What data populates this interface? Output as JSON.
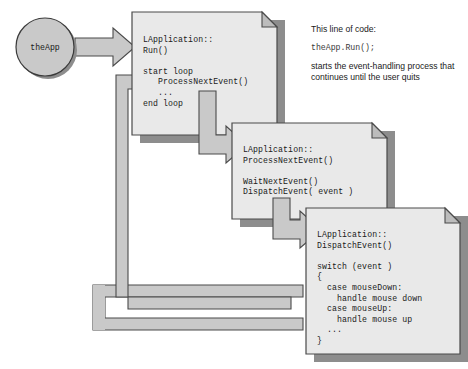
{
  "diagram": {
    "type": "flow-diagram",
    "colors": {
      "card_fill": "#e9e9e9",
      "card_border": "#4a4a4a",
      "card_shadow": "#7a7a7a",
      "arrow_fill": "#c9c9c9",
      "arrow_border": "#4a4a4a",
      "ellipse_fill": "#c9c9c9",
      "ellipse_border": "#3a3a3a",
      "fold_fill": "#bcbcbc",
      "text": "#1a1a1a",
      "background": "#ffffff"
    },
    "start_node": {
      "label": "theApp",
      "shape": "ellipse"
    },
    "cards": [
      {
        "id": "card-run",
        "lines": [
          "LApplication::",
          "Run()",
          "",
          "start loop",
          "   ProcessNextEvent()",
          "   ...",
          "end loop"
        ]
      },
      {
        "id": "card-process-next-event",
        "lines": [
          "LApplication::",
          "ProcessNextEvent()",
          "",
          "WaitNextEvent()",
          "DispatchEvent( event )"
        ]
      },
      {
        "id": "card-dispatch-event",
        "lines": [
          "LApplication::",
          "DispatchEvent()",
          "",
          "switch (event )",
          "{",
          "  case mouseDown:",
          "    handle mouse down",
          "  case mouseUp:",
          "    handle mouse up",
          "  ...",
          "}"
        ]
      }
    ],
    "annotation": {
      "intro": "This line of code:",
      "code": "theApp.Run();",
      "body": "starts the event-handling process that continues until the user quits"
    },
    "arrows": [
      {
        "id": "arrow-theapp-to-run",
        "from": "theApp",
        "to": "card-run",
        "direction": "right"
      },
      {
        "id": "arrow-run-to-process",
        "from": "card-run",
        "to": "card-process-next-event",
        "direction": "down-right"
      },
      {
        "id": "arrow-process-to-dispatch",
        "from": "card-process-next-event",
        "to": "card-dispatch-event",
        "direction": "down-right"
      },
      {
        "id": "arrow-return-inner",
        "from": "card-dispatch-event",
        "to": "card-run",
        "direction": "loop-back"
      },
      {
        "id": "arrow-return-outer",
        "from": "card-dispatch-event",
        "to": "card-run",
        "direction": "loop-back"
      }
    ]
  }
}
